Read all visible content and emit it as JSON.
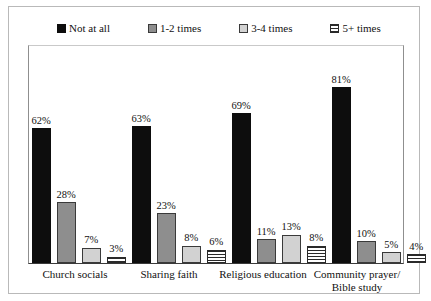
{
  "chart_data": {
    "type": "bar",
    "title": "",
    "subtitle": "",
    "xlabel": "",
    "ylabel": "",
    "ylim": [
      0,
      100
    ],
    "grid": false,
    "legend_position": "top",
    "value_suffix": "%",
    "categories": [
      "Church socials",
      "Sharing faith",
      "Religious education",
      "Community prayer/ Bible study"
    ],
    "category_lines": [
      [
        "Church socials"
      ],
      [
        "Sharing faith"
      ],
      [
        "Religious education"
      ],
      [
        "Community prayer/",
        "Bible study"
      ]
    ],
    "series": [
      {
        "name": "Not at all",
        "swatch": "solid",
        "color": "#0d0d0d",
        "values": [
          62,
          63,
          69,
          81
        ],
        "labels": [
          "62%",
          "63%",
          "69%",
          "81%"
        ]
      },
      {
        "name": "1-2 times",
        "swatch": "mid",
        "color": "#8e8e8e",
        "values": [
          28,
          23,
          11,
          10
        ],
        "labels": [
          "28%",
          "23%",
          "11%",
          "10%"
        ]
      },
      {
        "name": "3-4 times",
        "swatch": "light",
        "color": "#d2d2d2",
        "values": [
          7,
          8,
          13,
          5
        ],
        "labels": [
          "7%",
          "8%",
          "13%",
          "5%"
        ]
      },
      {
        "name": "5+ times",
        "swatch": "stripe",
        "color": "#ffffff",
        "values": [
          3,
          6,
          8,
          4
        ],
        "labels": [
          "3%",
          "6%",
          "8%",
          "4%"
        ]
      }
    ]
  }
}
